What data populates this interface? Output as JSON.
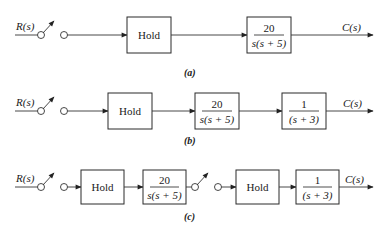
{
  "diagrams": [
    {
      "id": "a",
      "caption": "(a)",
      "input_label": "R(s)",
      "output_label": "C(s)",
      "blocks": [
        {
          "type": "hold",
          "label": "Hold"
        },
        {
          "type": "tf",
          "numerator": "20",
          "denominator": "s(s + 5)"
        }
      ],
      "samplers": 1
    },
    {
      "id": "b",
      "caption": "(b)",
      "input_label": "R(s)",
      "output_label": "C(s)",
      "blocks": [
        {
          "type": "hold",
          "label": "Hold"
        },
        {
          "type": "tf",
          "numerator": "20",
          "denominator": "s(s + 5)"
        },
        {
          "type": "tf",
          "numerator": "1",
          "denominator": "(s + 3)"
        }
      ],
      "samplers": 1
    },
    {
      "id": "c",
      "caption": "(c)",
      "input_label": "R(s)",
      "output_label": "C(s)",
      "blocks": [
        {
          "type": "hold",
          "label": "Hold"
        },
        {
          "type": "tf",
          "numerator": "20",
          "denominator": "s(s + 5)"
        },
        {
          "type": "hold",
          "label": "Hold"
        },
        {
          "type": "tf",
          "numerator": "1",
          "denominator": "(s + 3)"
        }
      ],
      "samplers": 2
    }
  ],
  "colors": {
    "stroke": "#2a2a2a",
    "background": "#ffffff",
    "text": "#1a1a1a"
  }
}
